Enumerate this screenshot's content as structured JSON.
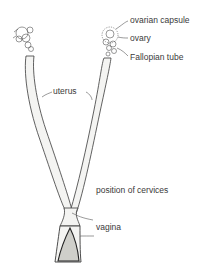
{
  "diagram": {
    "labels": {
      "ovarian_capsule": "ovarian capsule",
      "ovary": "ovary",
      "fallopian_tube": "Fallopian tube",
      "uterus": "uterus",
      "position_of_cervices": "position of cervices",
      "vagina": "vagina"
    },
    "colors": {
      "line": "#3a3a3a",
      "fill": "#f4f4f2",
      "shade": "#cfcfca",
      "background": "#ffffff"
    }
  }
}
